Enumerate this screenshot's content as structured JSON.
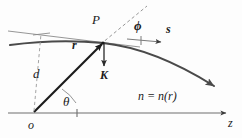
{
  "figure": {
    "type": "ray-optics-diagram",
    "background_color": "#fdfdfd",
    "ink_color": "#1b1b1b",
    "width": 242,
    "height": 138,
    "labels": {
      "point_P": "P",
      "angle_phi": "ϕ",
      "unit_vector_s": "s",
      "position_vector_r": "r",
      "vector_K": "K",
      "perpendicular_distance_d": "d",
      "angle_theta": "θ",
      "index_relation": "n = n(r)",
      "origin": "o",
      "axis_z": "z"
    },
    "geometry": {
      "origin_point": [
        34,
        113
      ],
      "point_P": [
        103,
        42
      ],
      "z_axis": {
        "x_start": 8,
        "x_end": 232,
        "y": 113
      },
      "ray_curve": "starts upper-left at (10,44), passes through P at (103,42), curves down to arrowhead at (218,88)",
      "tangent_line": "thin straight line from (8,33) through P",
      "normal_dashed_line": "dashed line from P up-right to (144,6)",
      "d_dashed_line": "vertical dashed line from (34,113) up to (40,33)",
      "K_arrow": "from P (103,42) down to (103,66)",
      "s_arrow": "from (128,40) right to (163,42)",
      "r_arrow": "from origin (34,113) to P (103,42)",
      "z_axis_tick": [
        77,
        113
      ],
      "phi_tick": [
        141,
        40
      ]
    }
  }
}
